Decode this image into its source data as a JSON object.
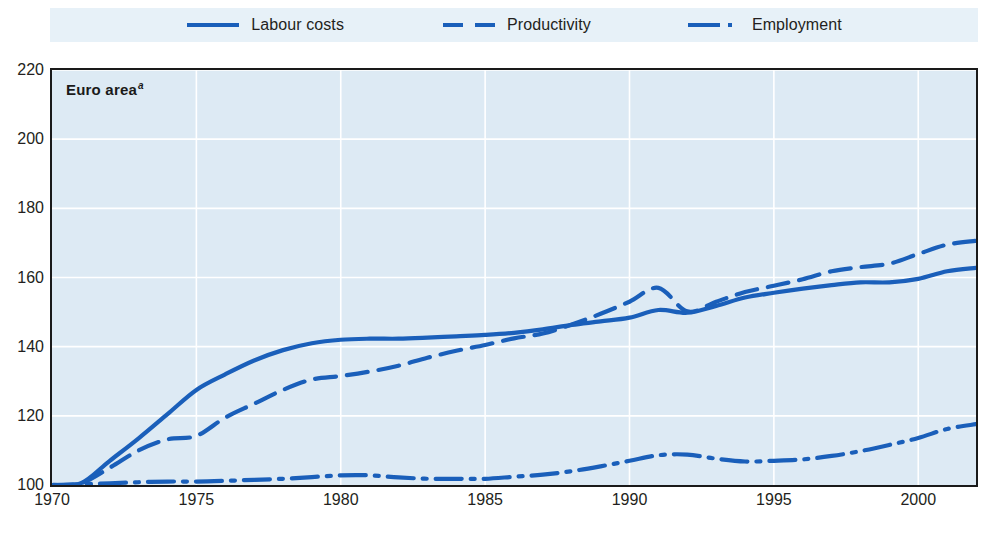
{
  "chart_data": {
    "type": "line",
    "title": "Euro area",
    "title_superscript": "a",
    "xlabel": "",
    "ylabel": "",
    "xlim": [
      1970,
      2002
    ],
    "ylim": [
      100,
      220
    ],
    "xticks": [
      1970,
      1975,
      1980,
      1985,
      1990,
      1995,
      2000
    ],
    "yticks": [
      100,
      120,
      140,
      160,
      180,
      200,
      220
    ],
    "grid": true,
    "legend_position": "top",
    "background_color": "#ddeaf4",
    "line_color": "#1a5fba",
    "x": [
      1970,
      1971,
      1972,
      1973,
      1974,
      1975,
      1976,
      1977,
      1978,
      1979,
      1980,
      1981,
      1982,
      1983,
      1984,
      1985,
      1986,
      1987,
      1988,
      1989,
      1990,
      1991,
      1992,
      1993,
      1994,
      1995,
      1996,
      1997,
      1998,
      1999,
      2000,
      2001,
      2002
    ],
    "series": [
      {
        "name": "Labour costs",
        "style": "solid",
        "color": "#1a5fba",
        "values": [
          100.0,
          100.5,
          107.0,
          113.5,
          120.5,
          127.5,
          132.0,
          136.0,
          139.0,
          141.0,
          142.0,
          142.3,
          142.3,
          142.6,
          143.0,
          143.4,
          144.0,
          145.0,
          146.3,
          147.3,
          148.4,
          150.6,
          149.8,
          151.8,
          154.2,
          155.6,
          156.8,
          157.8,
          158.6,
          158.6,
          159.6,
          161.8,
          162.8
        ]
      },
      {
        "name": "Productivity",
        "style": "dashed",
        "color": "#1a5fba",
        "values": [
          100.0,
          100.5,
          105.0,
          110.0,
          113.2,
          114.2,
          119.5,
          123.5,
          127.5,
          130.5,
          131.5,
          132.8,
          134.5,
          136.8,
          138.8,
          140.5,
          142.4,
          143.8,
          146.4,
          149.5,
          153.0,
          157.0,
          150.2,
          153.0,
          155.8,
          157.6,
          159.5,
          161.8,
          163.0,
          164.0,
          166.8,
          169.5,
          170.6
        ]
      },
      {
        "name": "Employment",
        "style": "dash-dot",
        "color": "#1a5fba",
        "values": [
          100.0,
          100.2,
          100.5,
          100.8,
          101.0,
          101.0,
          101.2,
          101.5,
          101.8,
          102.3,
          102.8,
          102.8,
          102.2,
          101.8,
          101.8,
          101.8,
          102.4,
          103.0,
          104.0,
          105.4,
          107.0,
          108.6,
          108.8,
          107.6,
          106.8,
          107.0,
          107.4,
          108.4,
          109.8,
          111.6,
          113.6,
          116.2,
          117.6
        ]
      }
    ]
  },
  "legend": {
    "items": [
      {
        "label": "Labour costs",
        "swatch": "solid-line-swatch"
      },
      {
        "label": "Productivity",
        "swatch": "dashed-line-swatch"
      },
      {
        "label": "Employment",
        "swatch": "dash-dot-line-swatch"
      }
    ]
  },
  "axes": {
    "y_tick_labels": [
      "220",
      "200",
      "180",
      "160",
      "140",
      "120",
      "100"
    ],
    "x_tick_labels": [
      "1970",
      "1975",
      "1980",
      "1985",
      "1990",
      "1995",
      "2000"
    ]
  }
}
